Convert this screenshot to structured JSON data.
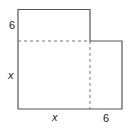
{
  "diagram": {
    "type": "composite-shape",
    "colors": {
      "outline": "#555555",
      "dashed": "#777777",
      "text": "#222222",
      "background": "#ffffff"
    },
    "labels": {
      "left_top": "6",
      "left_side": "x",
      "bottom_left": "x",
      "bottom_right": "6"
    }
  }
}
